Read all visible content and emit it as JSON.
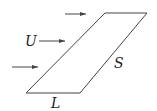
{
  "diagram": {
    "labels": {
      "flow_velocity": "U",
      "side_length": "S",
      "base_length": "L"
    },
    "colors": {
      "stroke": "#444444",
      "background": "#ffffff"
    },
    "arrows": [
      {
        "name": "top-arrow"
      },
      {
        "name": "middle-arrow"
      },
      {
        "name": "bottom-arrow"
      }
    ],
    "shape": "parallelogram"
  }
}
